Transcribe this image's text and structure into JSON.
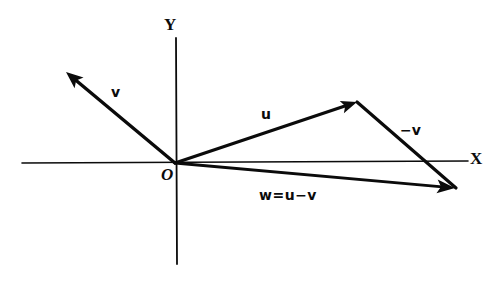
{
  "figure": {
    "background_color": "#ffffff",
    "ink_color": "#0b0b0b",
    "width": 498,
    "height": 283
  },
  "axes": {
    "x": {
      "label": "X",
      "label_x": 470,
      "label_y": 150,
      "x1": 22,
      "y1": 163,
      "x2": 468,
      "y2": 161,
      "stroke_width": 1.6
    },
    "y": {
      "label": "Y",
      "label_x": 164,
      "label_y": 16,
      "x1": 176,
      "y1": 38,
      "x2": 177,
      "y2": 264,
      "stroke_width": 1.8
    },
    "origin": {
      "label": "O",
      "x": 175,
      "y": 163,
      "label_x": 161,
      "label_y": 166
    }
  },
  "vectors": [
    {
      "id": "v",
      "label": "v",
      "label_x": 111,
      "label_y": 85,
      "tail_x": 175,
      "tail_y": 163,
      "head_x": 66,
      "head_y": 72,
      "stroke_width": 3.4,
      "arrow_length": 17,
      "arrow_width": 7,
      "has_arrow_head": true
    },
    {
      "id": "u",
      "label": "u",
      "label_x": 261,
      "label_y": 107,
      "tail_x": 175,
      "tail_y": 163,
      "head_x": 357,
      "head_y": 102,
      "stroke_width": 3.2,
      "arrow_length": 16,
      "arrow_width": 6.5,
      "has_arrow_head": true
    },
    {
      "id": "minus-v",
      "label": "−v",
      "label_x": 400,
      "label_y": 123,
      "tail_x": 357,
      "tail_y": 102,
      "head_x": 456,
      "head_y": 188,
      "stroke_width": 3.2,
      "arrow_length": 0,
      "arrow_width": 0,
      "has_arrow_head": false
    },
    {
      "id": "w",
      "label": "w=u−v",
      "label_x": 259,
      "label_y": 188,
      "tail_x": 175,
      "tail_y": 163,
      "head_x": 455,
      "head_y": 188,
      "stroke_width": 3.0,
      "arrow_length": 18,
      "arrow_width": 7,
      "has_arrow_head": true
    }
  ],
  "chart_data": {
    "type": "scatter",
    "xlabel": "X",
    "ylabel": "Y",
    "grid": false,
    "legend": "none",
    "annotations": [
      "v",
      "u",
      "−v",
      "w=u−v",
      "O",
      "X",
      "Y"
    ],
    "origin_pixel": [
      175,
      163
    ],
    "series": [
      {
        "name": "v",
        "tail": [
          0,
          0
        ],
        "head": [
          -109,
          91
        ],
        "pixel_tail": [
          175,
          163
        ],
        "pixel_head": [
          66,
          72
        ]
      },
      {
        "name": "u",
        "tail": [
          0,
          0
        ],
        "head": [
          182,
          61
        ],
        "pixel_tail": [
          175,
          163
        ],
        "pixel_head": [
          357,
          102
        ]
      },
      {
        "name": "-v",
        "tail": [
          182,
          61
        ],
        "head": [
          281,
          -25
        ],
        "pixel_tail": [
          357,
          102
        ],
        "pixel_head": [
          456,
          188
        ]
      },
      {
        "name": "w=u-v",
        "tail": [
          0,
          0
        ],
        "head": [
          280,
          -25
        ],
        "pixel_tail": [
          175,
          163
        ],
        "pixel_head": [
          455,
          188
        ]
      }
    ]
  }
}
